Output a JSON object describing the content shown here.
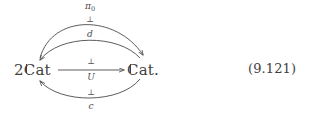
{
  "figure": {
    "type": "commutative-diagram",
    "equation_number": "(9.121)",
    "stroke_color": "#4a4a4a",
    "text_color": "#3f3f3f",
    "background": "#ffffff"
  },
  "nodes": {
    "left": {
      "id": "2Cat",
      "prefix": "2",
      "blackboard": "C",
      "suffix": "at",
      "full": "2ℂat"
    },
    "right": {
      "id": "Cat",
      "prefix": "",
      "blackboard": "C",
      "suffix": "at.",
      "full": "ℂat."
    }
  },
  "arrows": [
    {
      "name": "pi0-arrow",
      "label": "π",
      "subscript": "0",
      "from": "2Cat",
      "to": "Cat",
      "direction": "right",
      "curvature": "outer-top"
    },
    {
      "name": "d-arrow",
      "label": "d",
      "subscript": "",
      "from": "Cat",
      "to": "2Cat",
      "direction": "left",
      "curvature": "inner-top"
    },
    {
      "name": "U-arrow",
      "label": "U",
      "subscript": "",
      "from": "2Cat",
      "to": "Cat",
      "direction": "right",
      "curvature": "straight"
    },
    {
      "name": "c-arrow",
      "label": "c",
      "subscript": "",
      "from": "Cat",
      "to": "2Cat",
      "direction": "left",
      "curvature": "bottom"
    }
  ],
  "adjunctions": [
    {
      "name": "adjunction-top",
      "symbol": "⊥"
    },
    {
      "name": "adjunction-middle-upper",
      "symbol": "⊥"
    },
    {
      "name": "adjunction-middle-lower",
      "symbol": "⊥"
    }
  ]
}
